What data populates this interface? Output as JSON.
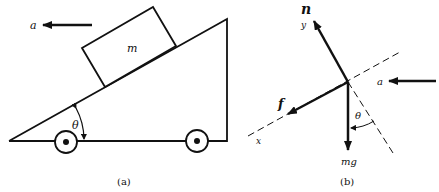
{
  "figure_a": {
    "caption": "(a)",
    "block_label": "m",
    "acceleration_label": "a",
    "angle_label": "θ"
  },
  "figure_b": {
    "caption": "(b)",
    "normal_force_label": "n",
    "y_axis_label": "y",
    "x_axis_label": "x",
    "friction_label": "f",
    "weight_label": "mg",
    "acceleration_label": "a",
    "angle_label": "θ"
  }
}
